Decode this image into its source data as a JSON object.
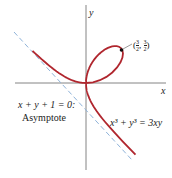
{
  "figure": {
    "axes": {
      "x_label": "x",
      "y_label": "y"
    },
    "curve": {
      "equation": "x³ + y³ = 3xy",
      "color": "#b0262e"
    },
    "asymptote": {
      "equation": "x + y + 1 = 0:",
      "label": "Asymptote",
      "color": "#8fb3d9"
    },
    "point": {
      "label": "(3/2, 3/2)",
      "x": 1.5,
      "y": 1.5
    }
  }
}
